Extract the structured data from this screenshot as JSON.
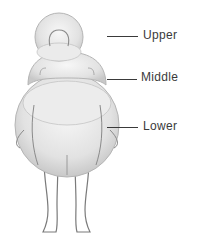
{
  "diagram": {
    "labels": [
      {
        "id": "upper",
        "text": "Upper"
      },
      {
        "id": "middle",
        "text": "Middle"
      },
      {
        "id": "lower",
        "text": "Lower"
      }
    ],
    "colors": {
      "sphere_fill": "#e6e6e6",
      "sphere_edge": "#b5b5b5",
      "outline": "#7a7a7a",
      "label_text": "#3a3a3a"
    }
  }
}
